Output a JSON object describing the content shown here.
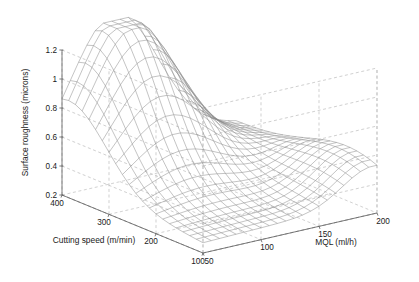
{
  "figure": {
    "background_color": "#ffffff",
    "width": 419,
    "height": 282,
    "mesh_color": "#8a8a8a",
    "axis_color": "#5a5a5a",
    "grid_color": "#b9b9b9",
    "text_color": "#1a1a1a"
  },
  "chart_data": {
    "type": "surface",
    "title": "",
    "xlabel": "MQL (ml/h)",
    "ylabel": "Cutting speed (m/min)",
    "zlabel": "Surface roughness (microns)",
    "grid": true,
    "legend": "none",
    "xlim": [
      50,
      200
    ],
    "ylim": [
      100,
      400
    ],
    "zlim": [
      0.2,
      1.2
    ],
    "xticks": [
      50,
      100,
      150,
      200
    ],
    "yticks": [
      100,
      200,
      300,
      400
    ],
    "zticks": [
      0.2,
      0.4,
      0.6,
      0.8,
      1,
      1.2
    ],
    "xtick_labels": [
      "50",
      "100",
      "150",
      "200"
    ],
    "ytick_labels": [
      "100",
      "200",
      "300",
      "400"
    ],
    "ztick_labels": [
      "0.2",
      "0.4",
      "0.6",
      "0.8",
      "1",
      "1.2"
    ],
    "mesh_rows": 22,
    "mesh_cols": 22,
    "x_name": "MQL",
    "y_name": "Cutting speed",
    "z_name": "Surface roughness",
    "peak": {
      "x": 95,
      "y": 370,
      "z": 1.25
    },
    "secondary_ridge": {
      "x": 185,
      "y": 150,
      "z": 0.52
    },
    "valley_z": 0.24,
    "z_model": {
      "base": 0.27,
      "peak_amp": 1.02,
      "peak_mql": 95,
      "peak_speed": 382,
      "sigma_mql": 38,
      "sigma_speed": 78,
      "ridge_amp": 0.26,
      "ridge_mql": 196,
      "ridge_speed": 150,
      "ridge_sigma_mql": 26,
      "ridge_sigma_speed": 105,
      "speed_tilt": 0.1,
      "mql_tilt": 0.03
    },
    "view": {
      "azimuth_deg": -37.5,
      "elevation_deg": 30
    },
    "z_values_sampled": {
      "note": "Surface roughness at sampled (MQL, cutting speed) pairs",
      "mql": [
        50,
        100,
        150,
        200
      ],
      "cutting_speed": [
        100,
        200,
        300,
        400
      ],
      "rows": [
        {
          "cutting_speed": 400,
          "values": [
            0.62,
            1.22,
            0.72,
            0.42
          ]
        },
        {
          "cutting_speed": 300,
          "values": [
            0.48,
            0.86,
            0.55,
            0.4
          ]
        },
        {
          "cutting_speed": 200,
          "values": [
            0.36,
            0.44,
            0.38,
            0.45
          ]
        },
        {
          "cutting_speed": 100,
          "values": [
            0.3,
            0.28,
            0.33,
            0.52
          ]
        }
      ]
    }
  },
  "geometry": {
    "origin_x": 62,
    "origin_y": 195,
    "front_x": 203,
    "front_y": 253,
    "right_x": 377,
    "right_y": 213,
    "z_top_offset": 145
  }
}
